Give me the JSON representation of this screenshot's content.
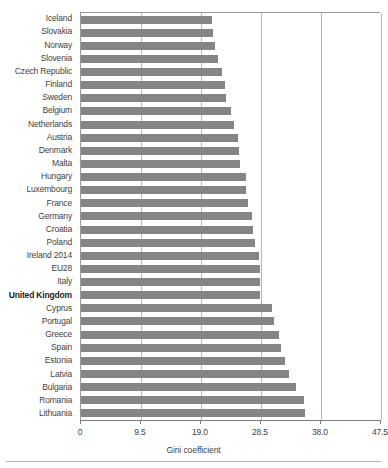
{
  "chart_data": {
    "type": "bar",
    "orientation": "horizontal",
    "title": "",
    "subtitle": "",
    "xlabel": "Gini coefficient",
    "ylabel": "",
    "xlim": [
      0,
      47.5
    ],
    "xticks": [
      "0",
      "9.5",
      "19.0",
      "28.5",
      "38.0",
      "47.5"
    ],
    "xtick_values": [
      0,
      9.5,
      19.0,
      28.5,
      38.0,
      47.5
    ],
    "grid": "vertical",
    "legend": "none",
    "bar_color": "#858585",
    "highlight_label": "United Kingdom",
    "categories": [
      "Iceland",
      "Slovakia",
      "Norway",
      "Slovenia",
      "Czech Republic",
      "Finland",
      "Sweden",
      "Belgium",
      "Netherlands",
      "Austria",
      "Denmark",
      "Malta",
      "Hungary",
      "Luxembourg",
      "France",
      "Germany",
      "Croatia",
      "Poland",
      "Ireland 2014",
      "EU28",
      "Italy",
      "United Kingdom",
      "Cyprus",
      "Portugal",
      "Greece",
      "Spain",
      "Estonia",
      "Latvia",
      "Bulgaria",
      "Romania",
      "Lithuania"
    ],
    "values": [
      20.8,
      20.9,
      21.2,
      21.7,
      22.4,
      22.8,
      23.0,
      23.8,
      24.3,
      24.8,
      25.0,
      25.1,
      26.1,
      26.2,
      26.5,
      27.0,
      27.3,
      27.5,
      28.2,
      28.3,
      28.4,
      28.4,
      30.2,
      30.5,
      31.4,
      31.7,
      32.3,
      33.0,
      34.1,
      35.3,
      35.5
    ],
    "bars": [
      {
        "label": "Iceland",
        "value": 20.8,
        "bold": false
      },
      {
        "label": "Slovakia",
        "value": 20.9,
        "bold": false
      },
      {
        "label": "Norway",
        "value": 21.2,
        "bold": false
      },
      {
        "label": "Slovenia",
        "value": 21.7,
        "bold": false
      },
      {
        "label": "Czech Republic",
        "value": 22.4,
        "bold": false
      },
      {
        "label": "Finland",
        "value": 22.8,
        "bold": false
      },
      {
        "label": "Sweden",
        "value": 23.0,
        "bold": false
      },
      {
        "label": "Belgium",
        "value": 23.8,
        "bold": false
      },
      {
        "label": "Netherlands",
        "value": 24.3,
        "bold": false
      },
      {
        "label": "Austria",
        "value": 24.8,
        "bold": false
      },
      {
        "label": "Denmark",
        "value": 25.0,
        "bold": false
      },
      {
        "label": "Malta",
        "value": 25.1,
        "bold": false
      },
      {
        "label": "Hungary",
        "value": 26.1,
        "bold": false
      },
      {
        "label": "Luxembourg",
        "value": 26.2,
        "bold": false
      },
      {
        "label": "France",
        "value": 26.5,
        "bold": false
      },
      {
        "label": "Germany",
        "value": 27.0,
        "bold": false
      },
      {
        "label": "Croatia",
        "value": 27.3,
        "bold": false
      },
      {
        "label": "Poland",
        "value": 27.5,
        "bold": false
      },
      {
        "label": "Ireland 2014",
        "value": 28.2,
        "bold": false
      },
      {
        "label": "EU28",
        "value": 28.3,
        "bold": false
      },
      {
        "label": "Italy",
        "value": 28.4,
        "bold": false
      },
      {
        "label": "United Kingdom",
        "value": 28.4,
        "bold": true
      },
      {
        "label": "Cyprus",
        "value": 30.2,
        "bold": false
      },
      {
        "label": "Portugal",
        "value": 30.5,
        "bold": false
      },
      {
        "label": "Greece",
        "value": 31.4,
        "bold": false
      },
      {
        "label": "Spain",
        "value": 31.7,
        "bold": false
      },
      {
        "label": "Estonia",
        "value": 32.3,
        "bold": false
      },
      {
        "label": "Latvia",
        "value": 33.0,
        "bold": false
      },
      {
        "label": "Bulgaria",
        "value": 34.1,
        "bold": false
      },
      {
        "label": "Romania",
        "value": 35.3,
        "bold": false
      },
      {
        "label": "Lithuania",
        "value": 35.5,
        "bold": false
      }
    ]
  }
}
